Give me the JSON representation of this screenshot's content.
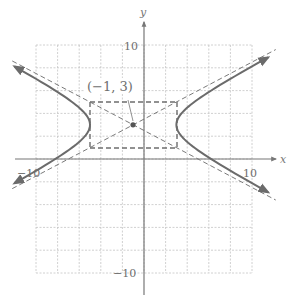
{
  "figure": {
    "equation": "(x+1)^2/16 - (y-3)^2/4 = 1",
    "center_label": "(−1, 3)",
    "axis_labels": {
      "x": "x",
      "y": "y"
    },
    "tick_labels": {
      "x_neg": "−10",
      "x_pos": "10",
      "y_pos": "10",
      "y_neg": "−10"
    },
    "colors": {
      "curve": "#6b6b6b",
      "asymptote": "#7a7a7a",
      "grid": "#c4c4c4",
      "axis": "#7a7a7a",
      "box": "#6e6e6e"
    }
  },
  "chart_data": {
    "type": "line",
    "title": "",
    "xlabel": "x",
    "ylabel": "y",
    "xlim": [
      -10,
      10
    ],
    "ylim": [
      -10,
      10
    ],
    "grid": true,
    "grid_step": 2,
    "center": {
      "x": -1,
      "y": 3,
      "label": "(−1, 3)"
    },
    "vertices": [
      {
        "x": -5,
        "y": 3
      },
      {
        "x": 3,
        "y": 3
      }
    ],
    "a": 4,
    "b": 2,
    "fundamental_rectangle": {
      "x_min": -5,
      "x_max": 3,
      "y_min": 1,
      "y_max": 5
    },
    "asymptotes": [
      "y - 3 = (1/2)(x + 1)",
      "y - 3 = -(1/2)(x + 1)"
    ],
    "series": [
      {
        "name": "right branch",
        "style": "solid",
        "description": "opens right from vertex (3, 3)"
      },
      {
        "name": "left branch",
        "style": "solid",
        "description": "opens left from vertex (-5, 3)"
      },
      {
        "name": "asymptotes",
        "style": "dashed"
      },
      {
        "name": "fundamental rectangle",
        "style": "dashed"
      }
    ],
    "tick_labels": {
      "x": [
        "−10",
        "10"
      ],
      "y": [
        "10",
        "−10"
      ]
    }
  }
}
